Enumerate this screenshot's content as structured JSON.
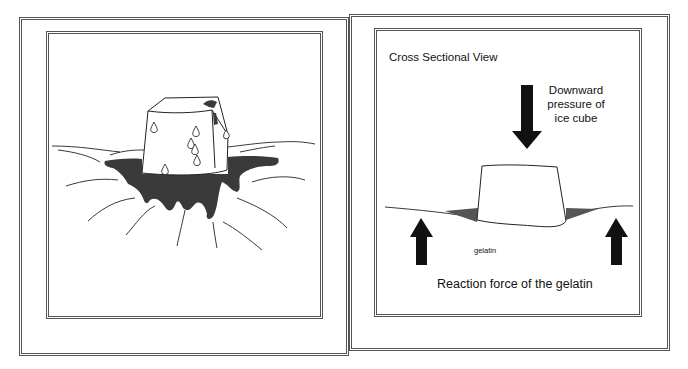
{
  "left_panel": {
    "description": "Ice cube sitting on gelatin surface with melted puddle"
  },
  "right_panel": {
    "title": "Cross Sectional View",
    "downward_label_line1": "Downward",
    "downward_label_line2": "pressure of",
    "downward_label_line3": "ice cube",
    "gelatin_label": "gelatin",
    "reaction_label": "Reaction force of the gelatin"
  },
  "colors": {
    "ink": "#111111",
    "puddle": "#3a3a3a",
    "border": "#555555"
  }
}
